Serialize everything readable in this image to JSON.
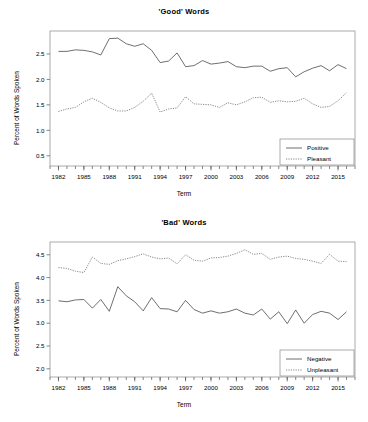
{
  "figure": {
    "panels": [
      "good",
      "bad"
    ],
    "background": "#ffffff",
    "line_color": "#4a4a4a"
  },
  "good": {
    "title": "'Good' Words",
    "xlabel": "Term",
    "ylabel": "Percent of Words Spoken",
    "legend": {
      "positive_label": "Positive",
      "pleasant_label": "Pleasant"
    },
    "ytick_labels": [
      "0.5",
      "1.0",
      "1.5",
      "2.0",
      "2.5"
    ],
    "xtick_labels": [
      "1982",
      "1985",
      "1988",
      "1991",
      "1994",
      "1997",
      "2000",
      "2003",
      "2006",
      "2009",
      "2012",
      "2015"
    ]
  },
  "bad": {
    "title": "'Bad' Words",
    "xlabel": "Term",
    "ylabel": "Percent of Words Spoken",
    "legend": {
      "negative_label": "Negative",
      "unpleasant_label": "Unpleasant"
    },
    "ytick_labels": [
      "2.0",
      "2.5",
      "3.0",
      "3.5",
      "4.0",
      "4.5"
    ],
    "xtick_labels": [
      "1982",
      "1985",
      "1988",
      "1991",
      "1994",
      "1997",
      "2000",
      "2003",
      "2006",
      "2009",
      "2012",
      "2015"
    ]
  },
  "chart_data": [
    {
      "type": "line",
      "title": "'Good' Words",
      "xlabel": "Term",
      "ylabel": "Percent of Words Spoken",
      "xlim": [
        1981,
        2017
      ],
      "ylim": [
        0.3,
        2.95
      ],
      "yticks": [
        0.5,
        1.0,
        1.5,
        2.0,
        2.5
      ],
      "xticks": [
        1982,
        1985,
        1988,
        1991,
        1994,
        1997,
        2000,
        2003,
        2006,
        2009,
        2012,
        2015
      ],
      "xticks_minor_every": 1,
      "grid": false,
      "legend_position": "bottom-right",
      "x": [
        1982,
        1983,
        1984,
        1985,
        1986,
        1987,
        1988,
        1989,
        1990,
        1991,
        1992,
        1993,
        1994,
        1995,
        1996,
        1997,
        1998,
        1999,
        2000,
        2001,
        2002,
        2003,
        2004,
        2005,
        2006,
        2007,
        2008,
        2009,
        2010,
        2011,
        2012,
        2013,
        2014,
        2015,
        2016
      ],
      "series": [
        {
          "name": "Positive",
          "style": "solid",
          "values": [
            2.55,
            2.55,
            2.58,
            2.57,
            2.54,
            2.48,
            2.8,
            2.81,
            2.7,
            2.65,
            2.7,
            2.57,
            2.33,
            2.36,
            2.52,
            2.25,
            2.27,
            2.37,
            2.3,
            2.32,
            2.35,
            2.25,
            2.23,
            2.26,
            2.26,
            2.16,
            2.21,
            2.23,
            2.05,
            2.15,
            2.22,
            2.27,
            2.17,
            2.29,
            2.21
          ]
        },
        {
          "name": "Pleasant",
          "style": "dotted",
          "values": [
            1.37,
            1.42,
            1.45,
            1.56,
            1.63,
            1.55,
            1.44,
            1.38,
            1.38,
            1.45,
            1.57,
            1.73,
            1.36,
            1.42,
            1.44,
            1.66,
            1.52,
            1.51,
            1.5,
            1.45,
            1.54,
            1.5,
            1.56,
            1.64,
            1.65,
            1.55,
            1.58,
            1.56,
            1.57,
            1.63,
            1.52,
            1.45,
            1.47,
            1.58,
            1.74
          ]
        }
      ]
    },
    {
      "type": "line",
      "title": "'Bad' Words",
      "xlabel": "Term",
      "ylabel": "Percent of Words Spoken",
      "xlim": [
        1981,
        2017
      ],
      "ylim": [
        1.82,
        4.78
      ],
      "yticks": [
        2.0,
        2.5,
        3.0,
        3.5,
        4.0,
        4.5
      ],
      "xticks": [
        1982,
        1985,
        1988,
        1991,
        1994,
        1997,
        2000,
        2003,
        2006,
        2009,
        2012,
        2015
      ],
      "xticks_minor_every": 1,
      "grid": false,
      "legend_position": "bottom-right",
      "x": [
        1982,
        1983,
        1984,
        1985,
        1986,
        1987,
        1988,
        1989,
        1990,
        1991,
        1992,
        1993,
        1994,
        1995,
        1996,
        1997,
        1998,
        1999,
        2000,
        2001,
        2002,
        2003,
        2004,
        2005,
        2006,
        2007,
        2008,
        2009,
        2010,
        2011,
        2012,
        2013,
        2014,
        2015,
        2016
      ],
      "series": [
        {
          "name": "Negative",
          "style": "solid",
          "values": [
            3.49,
            3.47,
            3.51,
            3.52,
            3.33,
            3.52,
            3.26,
            3.8,
            3.6,
            3.47,
            3.27,
            3.56,
            3.32,
            3.31,
            3.25,
            3.5,
            3.3,
            3.22,
            3.27,
            3.22,
            3.25,
            3.31,
            3.22,
            3.18,
            3.31,
            3.09,
            3.25,
            2.99,
            3.29,
            3.0,
            3.19,
            3.26,
            3.22,
            3.08,
            3.25
          ]
        },
        {
          "name": "Unpleasant",
          "style": "dotted",
          "values": [
            4.22,
            4.2,
            4.14,
            4.11,
            4.45,
            4.31,
            4.29,
            4.37,
            4.41,
            4.46,
            4.52,
            4.45,
            4.41,
            4.43,
            4.3,
            4.5,
            4.38,
            4.36,
            4.43,
            4.44,
            4.47,
            4.53,
            4.61,
            4.51,
            4.53,
            4.4,
            4.45,
            4.47,
            4.42,
            4.4,
            4.36,
            4.31,
            4.51,
            4.36,
            4.35
          ]
        }
      ]
    }
  ]
}
